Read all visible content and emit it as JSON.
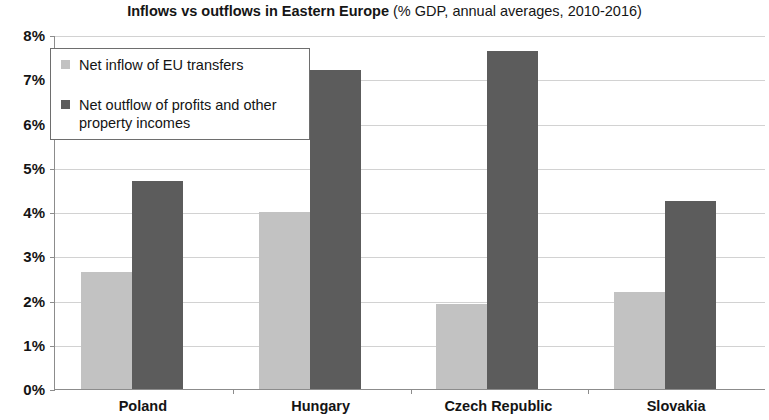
{
  "chart_data": {
    "type": "bar",
    "title": "Inflows vs outflows in Eastern Europe (% GDP, annual averages, 2010-2016)",
    "title_bold_part": "Inflows vs outflows in Eastern Europe",
    "title_regular_part": " (% GDP, annual averages, 2010-2016)",
    "xlabel": "",
    "ylabel": "",
    "ylim": [
      0,
      8
    ],
    "ytick_step": 1,
    "ytick_labels": [
      "8%",
      "7%",
      "6%",
      "5%",
      "4%",
      "3%",
      "2%",
      "1%",
      "0%"
    ],
    "ytick_values": [
      8,
      7,
      6,
      5,
      4,
      3,
      2,
      1,
      0
    ],
    "grid": true,
    "grid_axis": "y",
    "legend_position": "upper left",
    "categories": [
      "Poland",
      "Hungary",
      "Czech Republic",
      "Slovakia"
    ],
    "series": [
      {
        "name": "Net inflow of EU transfers",
        "color": "#c2c2c2",
        "values": [
          2.65,
          4.0,
          1.92,
          2.2
        ]
      },
      {
        "name": "Net outflow of profits and other property incomes",
        "color": "#5c5c5c",
        "values": [
          4.7,
          7.2,
          7.65,
          4.25
        ]
      }
    ]
  },
  "legend": {
    "items": [
      {
        "label": "Net inflow of EU transfers"
      },
      {
        "label": "Net outflow of profits and other property incomes"
      }
    ]
  },
  "colors": {
    "series_light": "#c2c2c2",
    "series_dark": "#5c5c5c",
    "axis": "#8c8c8c",
    "grid": "#d2d2d2",
    "background": "#ffffff",
    "text": "#141414"
  }
}
